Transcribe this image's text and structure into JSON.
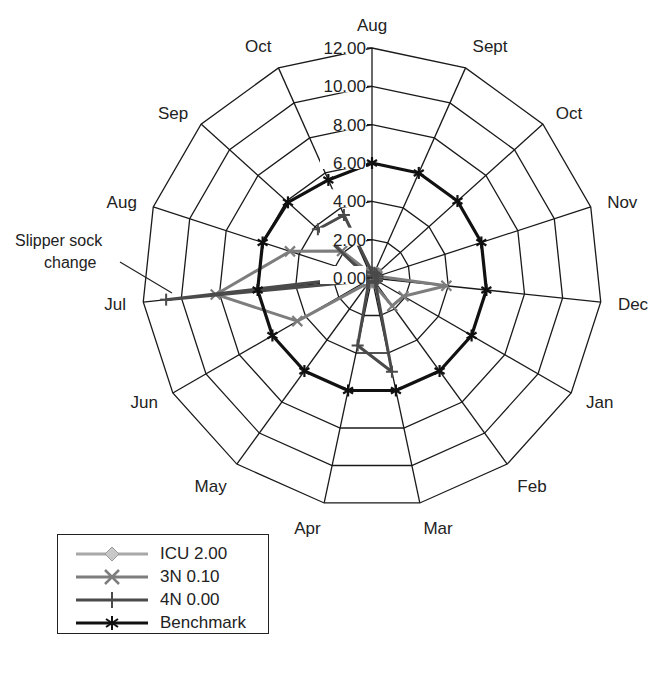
{
  "chart_data": {
    "type": "radar",
    "title": "",
    "axes": [
      "Aug",
      "Sept",
      "Oct",
      "Nov",
      "Dec",
      "Jan",
      "Feb",
      "Mar",
      "Apr",
      "May",
      "Jun",
      "Jul",
      "Aug",
      "Sep",
      "Oct"
    ],
    "radial_ticks": [
      "0.00",
      "2.00",
      "4.00",
      "6.00",
      "8.00",
      "10.00",
      "12.00"
    ],
    "rlim": [
      0,
      12
    ],
    "grid": true,
    "legend_position": "bottom-left",
    "series": [
      {
        "name": "ICU 2.00",
        "color": "#a8a8a8",
        "marker": "diamond",
        "values": [
          0.3,
          0.3,
          0.3,
          0.3,
          0.3,
          0.3,
          0.3,
          0.3,
          0.3,
          0.3,
          0.3,
          0.3,
          0.3,
          0.3,
          0.3
        ]
      },
      {
        "name": "3N 0.10",
        "color": "#7d7d7d",
        "marker": "x",
        "values": [
          0.3,
          0.3,
          0.3,
          0.3,
          3.9,
          1.9,
          1.8,
          0.3,
          0.3,
          0.3,
          4.5,
          8.2,
          4.5,
          2.1,
          0.3
        ]
      },
      {
        "name": "4N 0.00",
        "color": "#4a4a4a",
        "marker": "plus",
        "values": [
          0.3,
          0.3,
          0.3,
          0.3,
          0.3,
          0.3,
          0.3,
          5.0,
          3.6,
          0.3,
          0.3,
          10.8,
          0.3,
          3.8,
          3.6
        ]
      },
      {
        "name": "Benchmark",
        "color": "#111111",
        "marker": "star",
        "values": [
          6,
          6,
          6,
          6,
          6,
          6,
          6,
          6,
          6,
          6,
          6,
          6,
          6,
          5.9,
          5.6
        ]
      }
    ],
    "annotations": [
      {
        "text_line1": "Slipper sock",
        "text_line2": "change",
        "target_axis": "Jul"
      }
    ]
  },
  "legend": {
    "items": [
      {
        "label": "ICU 2.00"
      },
      {
        "label": "3N 0.10"
      },
      {
        "label": "4N 0.00"
      },
      {
        "label": "Benchmark"
      }
    ]
  },
  "annotation": {
    "line1": "Slipper sock",
    "line2": "change"
  }
}
